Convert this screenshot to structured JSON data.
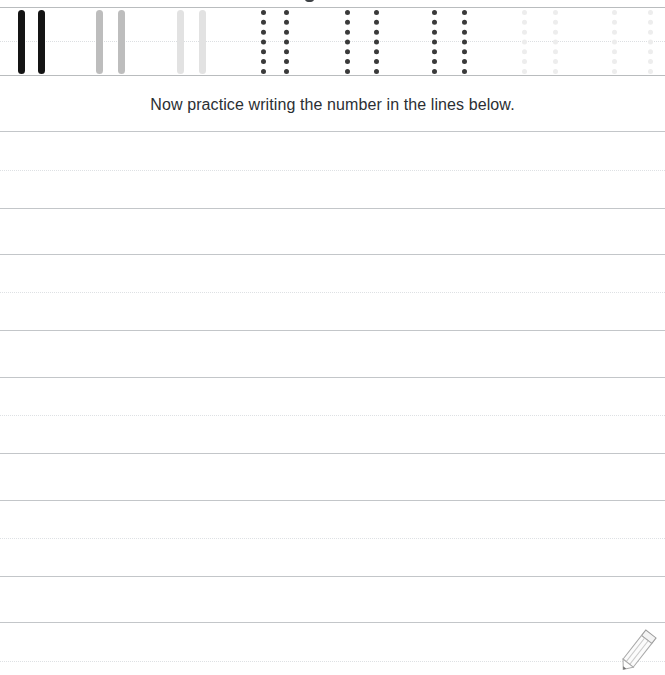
{
  "worksheet": {
    "title": "Number handwriting practice worksheet",
    "number": "1",
    "instruction": "Now practice writing the number in the lines below.",
    "colors": {
      "ink_dark": "#141414",
      "ink_mid": "#bdbdbd",
      "ink_light": "#e2e2e2",
      "guide_dark": "#3a3a3a",
      "guide_mid": "#9b9b9b",
      "guide_light": "#d8d8d8",
      "guide_faint": "#ededed",
      "rule_solid": "#c3c6c9",
      "rule_dashed": "#dee1e4",
      "band_rule": "#b9bcbe",
      "text": "#2b2f33"
    },
    "trace_band": {
      "label": "tracing row for the number 1",
      "baseline_top_y": 7,
      "midline_y": 41,
      "baseline_bottom_y": 75,
      "strokes": [
        {
          "x": 18,
          "style": "solid",
          "shade": "ink_dark",
          "group": 1
        },
        {
          "x": 38,
          "style": "solid",
          "shade": "ink_dark",
          "group": 1
        },
        {
          "x": 96,
          "style": "solid",
          "shade": "ink_mid",
          "group": 2
        },
        {
          "x": 118,
          "style": "solid",
          "shade": "ink_mid",
          "group": 2
        },
        {
          "x": 177,
          "style": "solid",
          "shade": "ink_light",
          "group": 3
        },
        {
          "x": 199,
          "style": "solid",
          "shade": "ink_light",
          "group": 3
        },
        {
          "x": 261,
          "style": "dotted",
          "shade": "guide_dark",
          "group": 4
        },
        {
          "x": 284,
          "style": "dotted",
          "shade": "guide_dark",
          "group": 4
        },
        {
          "x": 345,
          "style": "dotted",
          "shade": "guide_dark",
          "group": 5
        },
        {
          "x": 374,
          "style": "dotted",
          "shade": "guide_dark",
          "group": 5
        },
        {
          "x": 432,
          "style": "dotted",
          "shade": "guide_dark",
          "group": 6
        },
        {
          "x": 462,
          "style": "dotted",
          "shade": "guide_dark",
          "group": 6
        },
        {
          "x": 522,
          "style": "dotted",
          "shade": "guide_faint",
          "group": 7
        },
        {
          "x": 553,
          "style": "dotted",
          "shade": "guide_faint",
          "group": 7
        },
        {
          "x": 612,
          "style": "dotted",
          "shade": "guide_faint",
          "group": 8
        },
        {
          "x": 648,
          "style": "dotted",
          "shade": "guide_faint",
          "group": 8
        }
      ]
    },
    "practice_lines": [
      {
        "y": 131,
        "style": "solid"
      },
      {
        "y": 170,
        "style": "dashed"
      },
      {
        "y": 208,
        "style": "solid"
      },
      {
        "y": 254,
        "style": "solid"
      },
      {
        "y": 292,
        "style": "dashed"
      },
      {
        "y": 330,
        "style": "solid"
      },
      {
        "y": 377,
        "style": "solid"
      },
      {
        "y": 415,
        "style": "dashed"
      },
      {
        "y": 453,
        "style": "solid"
      },
      {
        "y": 500,
        "style": "solid"
      },
      {
        "y": 538,
        "style": "dashed"
      },
      {
        "y": 576,
        "style": "solid"
      },
      {
        "y": 622,
        "style": "solid"
      },
      {
        "y": 661,
        "style": "dashed"
      }
    ],
    "pencil_icon": "pencil-icon"
  }
}
